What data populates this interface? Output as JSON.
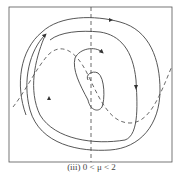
{
  "figure": {
    "caption": "(iii)  0 < μ < 2",
    "colors": {
      "stroke": "#444444",
      "background": "#ffffff"
    }
  }
}
